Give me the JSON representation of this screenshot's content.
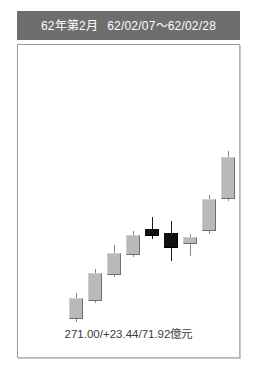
{
  "header": {
    "period_label": "62年第2月",
    "date_range": "62/02/07～62/02/28"
  },
  "footer": {
    "summary": "271.00/+23.44/71.92億元"
  },
  "colors": {
    "header_bg": "#6e6e6e",
    "header_text": "#ffffff",
    "panel_bg": "#ffffff",
    "panel_border": "#9a9a9a",
    "up_body": "#b9b9b9",
    "up_body_shadow": "#6f6f6f",
    "down_body": "#111111",
    "wick": "#8a8a8a",
    "footer_text": "#3b3b3b"
  },
  "chart_data": {
    "type": "candlestick",
    "title": "62年第2月",
    "subtitle": "62/02/07～62/02/28",
    "xlabel": "",
    "ylabel": "",
    "grid": false,
    "legend": null,
    "annotations": [
      "271.00/+23.44/71.92億元"
    ],
    "summary": {
      "close": 271.0,
      "change": 23.44,
      "volume": 71.92,
      "volume_unit": "億元"
    },
    "ylim": [
      236,
      300
    ],
    "xlim": [
      0,
      13
    ],
    "candles": [
      {
        "index": 0,
        "direction": "up",
        "open": 242.0,
        "high": 247.5,
        "low": 241.5,
        "close": 246.5
      },
      {
        "index": 1,
        "direction": "up",
        "open": 246.5,
        "high": 253.5,
        "low": 246.0,
        "close": 253.0
      },
      {
        "index": 2,
        "direction": "up",
        "open": 253.0,
        "high": 258.5,
        "low": 252.5,
        "close": 257.5
      },
      {
        "index": 3,
        "direction": "up",
        "open": 257.5,
        "high": 263.0,
        "low": 257.0,
        "close": 262.0
      },
      {
        "index": 4,
        "direction": "down",
        "open": 264.5,
        "high": 266.5,
        "low": 262.0,
        "close": 263.0
      },
      {
        "index": 5,
        "direction": "down",
        "open": 264.5,
        "high": 267.0,
        "low": 260.5,
        "close": 262.0
      },
      {
        "index": 6,
        "direction": "up",
        "open": 262.0,
        "high": 263.5,
        "low": 260.5,
        "close": 262.8
      },
      {
        "index": 7,
        "direction": "up",
        "open": 262.8,
        "high": 269.0,
        "low": 262.5,
        "close": 268.5
      },
      {
        "index": 8,
        "direction": "up",
        "open": 268.5,
        "high": 279.0,
        "low": 268.0,
        "close": 278.5
      },
      {
        "index": 9,
        "direction": "up",
        "open": 278.5,
        "high": 287.0,
        "low": 278.0,
        "close": 286.5
      },
      {
        "index": 10,
        "direction": "up",
        "open": 286.5,
        "high": 293.0,
        "low": 286.0,
        "close": 292.5
      },
      {
        "index": 11,
        "direction": "up",
        "open": 292.5,
        "high": 299.5,
        "low": 292.0,
        "close": 299.0
      }
    ],
    "geometry": {
      "plot_width": 221,
      "plot_height": 312,
      "body_width": 14,
      "items": [
        {
          "name": "candle-1",
          "direction": "up",
          "x": 51,
          "body_top": 253,
          "body_height": 21,
          "wick_top": 248,
          "wick_height": 29
        },
        {
          "name": "candle-2",
          "direction": "up",
          "x": 70,
          "body_top": 228,
          "body_height": 28,
          "wick_top": 224,
          "wick_height": 34
        },
        {
          "name": "candle-3",
          "direction": "up",
          "x": 89,
          "body_top": 208,
          "body_height": 22,
          "wick_top": 200,
          "wick_height": 32
        },
        {
          "name": "candle-4",
          "direction": "up",
          "x": 108,
          "body_top": 190,
          "body_height": 20,
          "wick_top": 186,
          "wick_height": 26
        },
        {
          "name": "candle-5",
          "direction": "down",
          "x": 127,
          "body_top": 184,
          "body_height": 7,
          "wick_top": 172,
          "wick_height": 22
        },
        {
          "name": "candle-6",
          "direction": "down",
          "x": 146,
          "body_top": 188,
          "body_height": 15,
          "wick_top": 176,
          "wick_height": 40
        },
        {
          "name": "candle-7",
          "direction": "up",
          "x": 165,
          "body_top": 192,
          "body_height": 7,
          "wick_top": 189,
          "wick_height": 22
        },
        {
          "name": "candle-8",
          "direction": "up",
          "x": 184,
          "body_top": 154,
          "body_height": 32,
          "wick_top": 150,
          "wick_height": 39
        },
        {
          "name": "candle-9",
          "direction": "up",
          "x": 203,
          "body_top": 112,
          "body_height": 42,
          "wick_top": 106,
          "wick_height": 50
        },
        {
          "name": "candle-10",
          "direction": "up",
          "x": 222,
          "body_top": 76,
          "body_height": 36,
          "wick_top": 72,
          "wick_height": 42
        },
        {
          "name": "candle-11",
          "direction": "up",
          "x": 241,
          "body_top": 50,
          "body_height": 26,
          "wick_top": 46,
          "wick_height": 32
        },
        {
          "name": "candle-12",
          "direction": "up",
          "x": 260,
          "body_top": 19,
          "body_height": 31,
          "wick_top": 15,
          "wick_height": 37
        }
      ]
    }
  }
}
